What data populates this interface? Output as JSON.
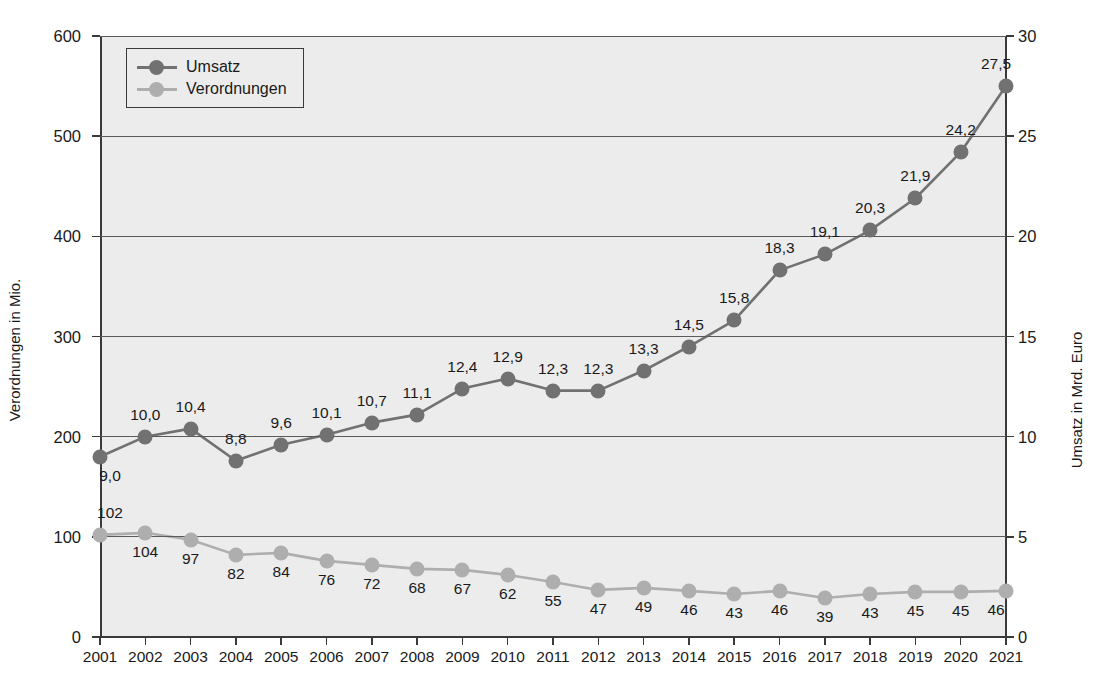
{
  "chart_data": {
    "type": "line",
    "title": "",
    "xlabel": "",
    "categories": [
      "2001",
      "2002",
      "2003",
      "2004",
      "2005",
      "2006",
      "2007",
      "2008",
      "2009",
      "2010",
      "2011",
      "2012",
      "2013",
      "2014",
      "2015",
      "2016",
      "2017",
      "2018",
      "2019",
      "2020",
      "2021"
    ],
    "grid": true,
    "legend_position": "top-left",
    "axes": {
      "left": {
        "title": "Verordnungen in Mio.",
        "ticks": [
          "0",
          "100",
          "200",
          "300",
          "400",
          "500",
          "600"
        ],
        "tick_values": [
          0,
          100,
          200,
          300,
          400,
          500,
          600
        ],
        "ylim": [
          0,
          600
        ]
      },
      "right": {
        "title": "Umsatz in Mrd. Euro",
        "ticks": [
          "0",
          "5",
          "10",
          "15",
          "20",
          "25",
          "30"
        ],
        "tick_values": [
          0,
          5,
          10,
          15,
          20,
          25,
          30
        ],
        "ylim": [
          0,
          30
        ]
      }
    },
    "series": [
      {
        "name": "Umsatz",
        "axis": "right",
        "color": "#717171",
        "values": [
          9.0,
          10.0,
          10.4,
          8.8,
          9.6,
          10.1,
          10.7,
          11.1,
          12.4,
          12.9,
          12.3,
          12.3,
          13.3,
          14.5,
          15.8,
          18.3,
          19.1,
          20.3,
          21.9,
          24.2,
          27.5
        ],
        "labels": [
          "9,0",
          "10,0",
          "10,4",
          "8,8",
          "9,6",
          "10,1",
          "10,7",
          "11,1",
          "12,4",
          "12,9",
          "12,3",
          "12,3",
          "13,3",
          "14,5",
          "15,8",
          "18,3",
          "19,1",
          "20,3",
          "21,9",
          "24,2",
          "27,5"
        ],
        "label_positions": [
          "below",
          "above",
          "above",
          "above",
          "above",
          "above",
          "above",
          "above",
          "above",
          "above",
          "above",
          "above",
          "above",
          "above",
          "above",
          "above",
          "above",
          "above",
          "above",
          "above",
          "above"
        ]
      },
      {
        "name": "Verordnungen",
        "axis": "left",
        "color": "#aeaeae",
        "values": [
          102,
          104,
          97,
          82,
          84,
          76,
          72,
          68,
          67,
          62,
          55,
          47,
          49,
          46,
          43,
          46,
          39,
          43,
          45,
          45,
          46
        ],
        "labels": [
          "102",
          "104",
          "97",
          "82",
          "84",
          "76",
          "72",
          "68",
          "67",
          "62",
          "55",
          "47",
          "49",
          "46",
          "43",
          "46",
          "39",
          "43",
          "45",
          "45",
          "46"
        ],
        "label_positions": [
          "above",
          "below",
          "below",
          "below",
          "below",
          "below",
          "below",
          "below",
          "below",
          "below",
          "below",
          "below",
          "below",
          "below",
          "below",
          "below",
          "below",
          "below",
          "below",
          "below",
          "below"
        ]
      }
    ]
  },
  "legend": {
    "items": [
      {
        "label": "Umsatz",
        "color": "#717171"
      },
      {
        "label": "Verordnungen",
        "color": "#aeaeae"
      }
    ]
  }
}
